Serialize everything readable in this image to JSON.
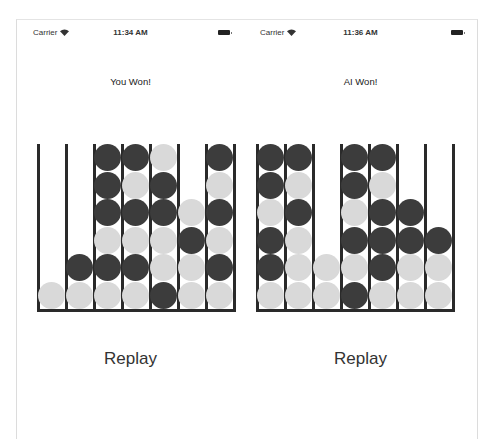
{
  "colors": {
    "dark_disc": "#3c3c3c",
    "light_disc": "#d9d9d9",
    "grid": "#2a2a2a"
  },
  "screens": [
    {
      "status": {
        "carrier": "Carrier",
        "time": "11:34 AM",
        "wifi_icon": "wifi-icon",
        "battery_icon": "battery-icon"
      },
      "result": "You Won!",
      "board": [
        [
          "",
          "",
          "D",
          "D",
          "L",
          "",
          "D"
        ],
        [
          "",
          "",
          "D",
          "L",
          "D",
          "",
          "L"
        ],
        [
          "",
          "",
          "D",
          "D",
          "D",
          "L",
          "D"
        ],
        [
          "",
          "",
          "L",
          "L",
          "L",
          "D",
          "L"
        ],
        [
          "",
          "D",
          "D",
          "D",
          "L",
          "L",
          "D"
        ],
        [
          "L",
          "L",
          "L",
          "L",
          "D",
          "L",
          "L"
        ]
      ],
      "replay_label": "Replay"
    },
    {
      "status": {
        "carrier": "Carrier",
        "time": "11:36 AM",
        "wifi_icon": "wifi-icon",
        "battery_icon": "battery-icon"
      },
      "result": "AI Won!",
      "board": [
        [
          "D",
          "D",
          "",
          "D",
          "D",
          "",
          ""
        ],
        [
          "D",
          "L",
          "",
          "D",
          "L",
          "",
          ""
        ],
        [
          "L",
          "D",
          "",
          "L",
          "D",
          "D",
          ""
        ],
        [
          "D",
          "L",
          "",
          "D",
          "D",
          "D",
          "D"
        ],
        [
          "D",
          "L",
          "L",
          "L",
          "D",
          "L",
          "L"
        ],
        [
          "L",
          "L",
          "L",
          "D",
          "L",
          "L",
          "L"
        ]
      ],
      "replay_label": "Replay"
    }
  ]
}
